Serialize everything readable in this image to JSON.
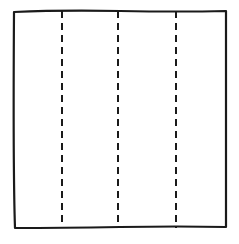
{
  "diagram": {
    "type": "folding-square",
    "background": "#ffffff",
    "stroke_color": "#1a1a1a",
    "square": {
      "x": 14,
      "y": 11,
      "width": 212,
      "height": 217
    },
    "fold_lines": [
      {
        "x": 62,
        "style": "dashed"
      },
      {
        "x": 118,
        "style": "dashed"
      },
      {
        "x": 176,
        "style": "dashed"
      }
    ]
  }
}
